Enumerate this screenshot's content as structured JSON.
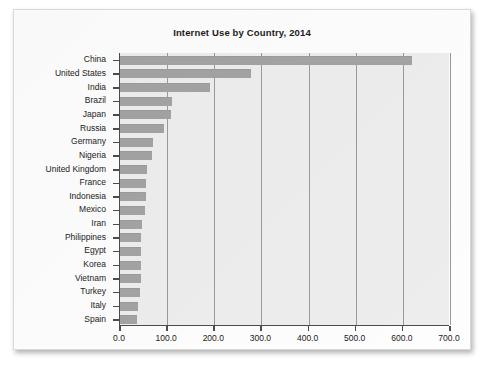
{
  "card": {
    "title": "Internet Use by Country, 2014"
  },
  "chart_data": {
    "type": "bar",
    "orientation": "horizontal",
    "title": "Internet Use by Country, 2014",
    "xlabel": "",
    "ylabel": "",
    "xlim": [
      0,
      700
    ],
    "ylim": null,
    "grid": true,
    "legend": null,
    "xticks": [
      "0.0",
      "100.0",
      "200.0",
      "300.0",
      "400.0",
      "500.0",
      "600.0",
      "700.0"
    ],
    "xtick_values": [
      0,
      100,
      200,
      300,
      400,
      500,
      600,
      700
    ],
    "categories": [
      "China",
      "United States",
      "India",
      "Brazil",
      "Japan",
      "Russia",
      "Germany",
      "Nigeria",
      "United Kingdom",
      "France",
      "Indonesia",
      "Mexico",
      "Iran",
      "Philippines",
      "Egypt",
      "Korea",
      "Vietnam",
      "Turkey",
      "Italy",
      "Spain"
    ],
    "values": [
      620,
      277,
      190,
      110,
      109,
      93,
      70,
      68,
      58,
      56,
      55,
      52,
      46,
      45,
      45,
      45,
      44,
      43,
      39,
      37
    ],
    "bar_color": "#a3a3a3",
    "plot_background": "#ededed",
    "axis_color": "#4c4c4c",
    "gridline_color": "#9a9a9a"
  }
}
